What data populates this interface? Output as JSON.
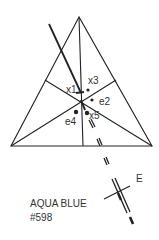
{
  "diagram": {
    "type": "triangular color diagram",
    "stroke_color": "#222222",
    "labels": {
      "x1": "x1",
      "x3": "x3",
      "e2": "e2",
      "e4": "e4",
      "x5": "x5",
      "E": "E"
    }
  },
  "caption": {
    "name": "AQUA BLUE",
    "code": "#598"
  }
}
